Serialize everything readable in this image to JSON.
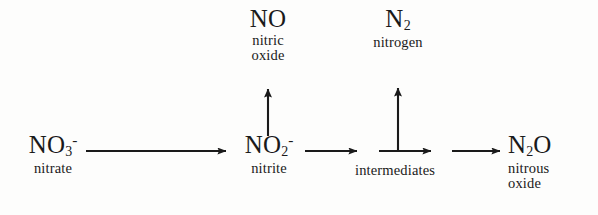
{
  "diagram": {
    "ink_color": "#1a1a1a",
    "background_color": "#fdfdfc",
    "nodes": {
      "nitrate": {
        "formula_main": "NO",
        "formula_sub": "3",
        "formula_sup": "-",
        "name": "nitrate"
      },
      "nitrite": {
        "formula_main": "NO",
        "formula_sub": "2",
        "formula_sup": "-",
        "name": "nitrite"
      },
      "nitric_oxide": {
        "formula_main": "NO",
        "formula_sub": "",
        "formula_sup": "",
        "name_line1": "nitric",
        "name_line2": "oxide"
      },
      "nitrogen": {
        "formula_main": "N",
        "formula_sub": "2",
        "formula_sup": "",
        "name": "nitrogen"
      },
      "intermediates": {
        "name": "intermediates"
      },
      "nitrous_oxide": {
        "formula_main_a": "N",
        "formula_sub": "2",
        "formula_main_b": "O",
        "name_line1": "nitrous",
        "name_line2": "oxide"
      }
    }
  }
}
